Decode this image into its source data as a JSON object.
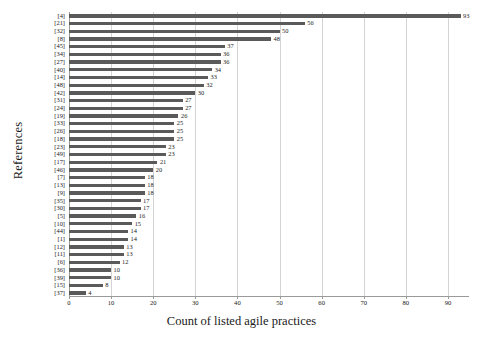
{
  "chart_data": {
    "type": "bar",
    "orientation": "horizontal",
    "title": "",
    "xlabel": "Count of listed agile practices",
    "ylabel": "References",
    "xlim": [
      0,
      95
    ],
    "ylim": null,
    "grid": true,
    "grid_axis": "x",
    "legend": null,
    "bar_color": "#5a5a5a",
    "show_data_labels": true,
    "xticks": [
      0,
      10,
      20,
      30,
      40,
      50,
      60,
      70,
      80,
      90
    ],
    "xticklabels": [
      "0",
      "10",
      "20",
      "30",
      "40",
      "50",
      "60",
      "70",
      "80",
      "90"
    ],
    "categories": [
      "[4]",
      "[21]",
      "[32]",
      "[8]",
      "[45]",
      "[34]",
      "[27]",
      "[40]",
      "[14]",
      "[48]",
      "[42]",
      "[31]",
      "[24]",
      "[19]",
      "[33]",
      "[26]",
      "[18]",
      "[23]",
      "[49]",
      "[17]",
      "[46]",
      "[7]",
      "[13]",
      "[9]",
      "[35]",
      "[30]",
      "[5]",
      "[10]",
      "[44]",
      "[1]",
      "[12]",
      "[11]",
      "[6]",
      "[36]",
      "[39]",
      "[15]",
      "[37]"
    ],
    "values": [
      93,
      56,
      50,
      48,
      37,
      36,
      36,
      34,
      33,
      32,
      30,
      27,
      27,
      26,
      25,
      25,
      25,
      23,
      23,
      21,
      20,
      18,
      18,
      18,
      17,
      17,
      16,
      15,
      14,
      14,
      13,
      13,
      12,
      10,
      10,
      8,
      4
    ],
    "data_labels": [
      "93",
      "56",
      "50",
      "48",
      "37",
      "36",
      "36",
      "34",
      "33",
      "32",
      "30",
      "27",
      "27",
      "26",
      "25",
      "25",
      "25",
      "23",
      "23",
      "21",
      "20",
      "18",
      "18",
      "18",
      "17",
      "17",
      "16",
      "15",
      "14",
      "14",
      "13",
      "13",
      "12",
      "10",
      "10",
      "8",
      "4"
    ]
  }
}
